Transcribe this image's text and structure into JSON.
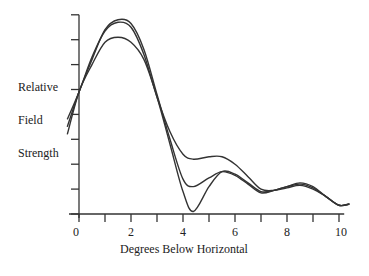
{
  "chart_data": {
    "type": "line",
    "title": "",
    "xlabel": "Degrees Below Horizontal",
    "ylabel": [
      "Relative",
      "Field",
      "Strength"
    ],
    "xlim": [
      -0.5,
      10.6
    ],
    "ylim": [
      0,
      8
    ],
    "x_ticks": [
      0,
      1,
      2,
      3,
      4,
      5,
      6,
      7,
      8,
      9,
      10
    ],
    "x_tick_labels": [
      "0",
      "2",
      "4",
      "6",
      "8",
      "10"
    ],
    "x_tick_label_values": [
      0,
      2,
      4,
      6,
      8,
      10
    ],
    "y_ticks": [
      0,
      1,
      2,
      3,
      4,
      5,
      6,
      7,
      8
    ],
    "y_tick_labels": [],
    "grid": false,
    "legend": null,
    "series": [
      {
        "name": "curve-1",
        "x": [
          -0.45,
          0,
          0.5,
          1,
          1.5,
          2,
          2.5,
          3,
          3.5,
          4,
          4.4,
          5,
          5.5,
          6,
          6.5,
          7,
          7.5,
          8,
          8.5,
          9,
          9.5,
          10,
          10.4
        ],
        "y": [
          3.5,
          4.9,
          6.2,
          7.4,
          7.8,
          7.65,
          6.6,
          4.8,
          3.0,
          1.4,
          1.1,
          1.45,
          1.7,
          1.55,
          1.2,
          0.85,
          0.95,
          1.1,
          1.2,
          1.05,
          0.7,
          0.35,
          0.4
        ]
      },
      {
        "name": "curve-2",
        "x": [
          -0.45,
          0,
          0.5,
          1,
          1.5,
          2,
          2.5,
          3,
          3.5,
          4,
          4.4,
          5,
          5.5,
          6,
          6.5,
          7,
          7.5,
          8,
          8.5,
          9,
          9.5,
          10,
          10.4
        ],
        "y": [
          3.8,
          4.9,
          6.3,
          7.35,
          7.7,
          7.5,
          6.4,
          4.7,
          3.3,
          2.4,
          2.2,
          2.3,
          2.3,
          2.0,
          1.5,
          1.0,
          0.95,
          1.05,
          1.15,
          1.0,
          0.7,
          0.35,
          0.4
        ]
      },
      {
        "name": "curve-3",
        "x": [
          -0.45,
          0,
          0.5,
          1,
          1.5,
          2,
          2.5,
          3,
          3.5,
          4,
          4.4,
          5,
          5.5,
          6,
          6.5,
          7,
          7.5,
          8,
          8.5,
          9,
          9.5,
          10,
          10.4
        ],
        "y": [
          3.2,
          4.9,
          6.0,
          6.9,
          7.1,
          6.9,
          6.2,
          4.7,
          2.8,
          0.9,
          0.1,
          1.1,
          1.7,
          1.6,
          1.25,
          0.9,
          0.95,
          1.1,
          1.25,
          1.1,
          0.7,
          0.35,
          0.4
        ]
      }
    ],
    "line_color": "#333333"
  },
  "labels": {
    "y1": "Relative",
    "y2": "Field",
    "y3": "Strength",
    "x": "Degrees Below Horizontal",
    "xt0": "0",
    "xt2": "2",
    "xt4": "4",
    "xt6": "6",
    "xt8": "8",
    "xt10": "10"
  }
}
